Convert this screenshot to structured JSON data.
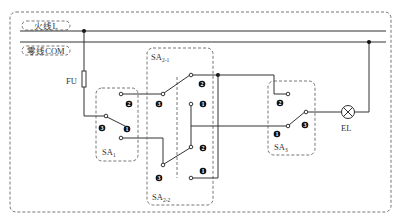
{
  "diagram": {
    "type": "wiring-diagram",
    "buses": {
      "live_label": "火线L",
      "neutral_label": "零线COM"
    },
    "components": {
      "fuse_label": "FU",
      "lamp_label": "EL",
      "sa1_label": "SA",
      "sa1_sub": "1",
      "sa2_1_label": "SA",
      "sa2_1_sub": "2-1",
      "sa2_2_label": "SA",
      "sa2_2_sub": "2-2",
      "sa3_label": "SA",
      "sa3_sub": "3"
    },
    "terminal_numbers": {
      "sa1": [
        "2",
        "3",
        "1"
      ],
      "sa2_1": [
        "3",
        "2",
        "1"
      ],
      "sa2_2": [
        "2",
        "1",
        "3"
      ],
      "sa3": [
        "2",
        "3",
        "1"
      ]
    }
  }
}
